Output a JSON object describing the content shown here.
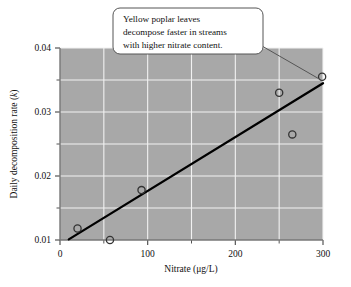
{
  "figure": {
    "background_color": "#ffffff",
    "plot_background_color": "#a8a8a8",
    "gridline_color": "#f2f2f2",
    "marker_edge_color": "#333333",
    "trendline_color": "#000000",
    "callout_fill": "#ffffff",
    "callout_border": "#555555"
  },
  "callout": {
    "line1": "Yellow poplar leaves",
    "line2": "decompose faster in streams",
    "line3": "with higher nitrate content."
  },
  "chart_data": {
    "type": "scatter",
    "title": "",
    "xlabel_text": "Nitrate (",
    "xlabel_mu": "μ",
    "xlabel_tail": "g/L)",
    "xlabel": "Nitrate (μg/L)",
    "ylabel_text": "Daily decomposition rate (",
    "ylabel_italic": "k",
    "ylabel_tail": ")",
    "ylabel": "Daily decomposition rate (k)",
    "xlim": [
      0,
      300
    ],
    "ylim": [
      0.01,
      0.04
    ],
    "grid": true,
    "legend": "none",
    "x_major_ticks": [
      0,
      100,
      200,
      300
    ],
    "x_major_tick_labels": [
      "0",
      "100",
      "200",
      "300"
    ],
    "x_minor_ticks": [
      50,
      150,
      250
    ],
    "y_major_ticks": [
      0.01,
      0.02,
      0.03,
      0.04
    ],
    "y_major_tick_labels": [
      "0.01",
      "0.02",
      "0.03",
      "0.04"
    ],
    "y_minor_ticks": [
      0.015,
      0.025,
      0.035
    ],
    "x": [
      20,
      57,
      93,
      250,
      265,
      299
    ],
    "y": [
      0.0118,
      0.01,
      0.0178,
      0.033,
      0.0265,
      0.0355
    ],
    "points": [
      {
        "x": 20,
        "y": 0.0118
      },
      {
        "x": 57,
        "y": 0.01
      },
      {
        "x": 93,
        "y": 0.0178
      },
      {
        "x": 250,
        "y": 0.033
      },
      {
        "x": 265,
        "y": 0.0265
      },
      {
        "x": 299,
        "y": 0.0355
      }
    ],
    "trendline": {
      "x_start": 10,
      "y_start": 0.0101,
      "x_end": 300,
      "y_end": 0.0345
    },
    "annotation_target": {
      "x": 299,
      "y": 0.0355
    }
  }
}
